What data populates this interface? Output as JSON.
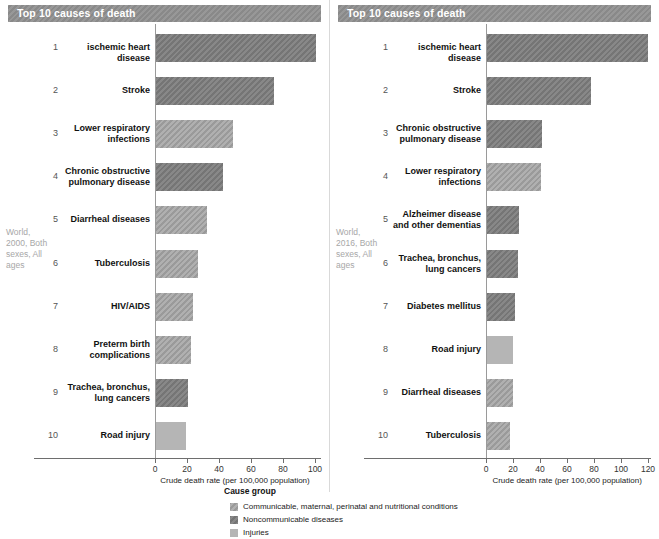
{
  "panels": [
    {
      "id": "left",
      "title": "Top 10 causes of death",
      "side_caption": "World, 2000, Both sexes, All ages",
      "axis_title": "Crude death rate (per 100,000 population)"
    },
    {
      "id": "right",
      "title": "Top 10 causes of death",
      "side_caption": "World, 2016, Both sexes, All ages",
      "axis_title": "Crude death rate (per 100,000 population)"
    }
  ],
  "legend": {
    "title": "Cause group",
    "items": [
      {
        "key": "cmnn",
        "label": "Communicable, maternal, perinatal and nutritional conditions",
        "color": "#a0a0a0"
      },
      {
        "key": "ncd",
        "label": "Noncommunicable diseases",
        "color": "#7b7b7b"
      },
      {
        "key": "inj",
        "label": "Injuries",
        "color": "#b5b5b5"
      }
    ]
  },
  "chart_data": [
    {
      "type": "bar",
      "orientation": "horizontal",
      "title": "Top 10 causes of death",
      "subtitle": "World, 2000, Both sexes, All ages",
      "xlabel": "Crude death rate (per 100,000 population)",
      "ylabel": "",
      "xlim": [
        0,
        112
      ],
      "xticks": [
        0,
        20,
        40,
        60,
        80,
        100
      ],
      "grid": false,
      "legend_position": "bottom-center",
      "ranks": [
        1,
        2,
        3,
        4,
        5,
        6,
        7,
        8,
        9,
        10
      ],
      "categories": [
        "ischemic heart disease",
        "Stroke",
        "Lower respiratory infections",
        "Chronic obstructive pulmonary disease",
        "Diarrheal diseases",
        "Tuberculosis",
        "HIV/AIDS",
        "Preterm birth complications",
        "Trachea, bronchus, lung cancers",
        "Road injury"
      ],
      "values": [
        100,
        74,
        48,
        42,
        32,
        26,
        23,
        22,
        20,
        19
      ],
      "groups": [
        "ncd",
        "ncd",
        "cmnn",
        "ncd",
        "cmnn",
        "cmnn",
        "cmnn",
        "cmnn",
        "ncd",
        "inj"
      ]
    },
    {
      "type": "bar",
      "orientation": "horizontal",
      "title": "Top 10 causes of death",
      "subtitle": "World, 2016, Both sexes, All ages",
      "xlabel": "Crude death rate (per 100,000 population)",
      "ylabel": "",
      "xlim": [
        0,
        133
      ],
      "xticks": [
        0,
        20,
        40,
        60,
        80,
        100,
        120
      ],
      "grid": false,
      "legend_position": "bottom-center",
      "ranks": [
        1,
        2,
        3,
        4,
        5,
        6,
        7,
        8,
        9,
        10
      ],
      "categories": [
        "ischemic heart disease",
        "Stroke",
        "Chronic obstructive pulmonary disease",
        "Lower respiratory infections",
        "Alzheimer disease and other dementias",
        "Trachea, bronchus, lung cancers",
        "Diabetes mellitus",
        "Road injury",
        "Diarrheal diseases",
        "Tuberculosis"
      ],
      "values": [
        119,
        77,
        41,
        40,
        24,
        23,
        21,
        19,
        19,
        17
      ],
      "groups": [
        "ncd",
        "ncd",
        "ncd",
        "cmnn",
        "ncd",
        "ncd",
        "ncd",
        "inj",
        "cmnn",
        "cmnn"
      ]
    }
  ]
}
